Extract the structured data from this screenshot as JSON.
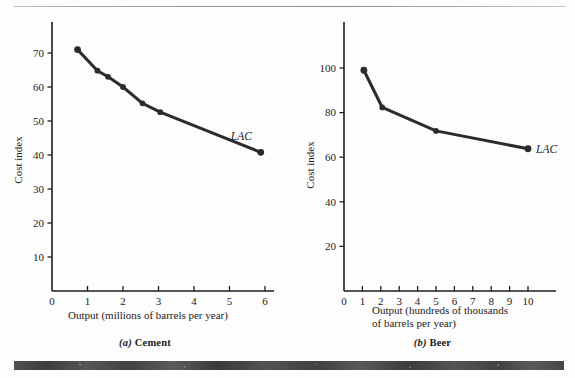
{
  "figure": {
    "panels": [
      {
        "id": "a",
        "caption_letter": "(a)",
        "caption_text": "Cement",
        "curve_label": "LAC"
      },
      {
        "id": "b",
        "caption_letter": "(b)",
        "caption_text": "Beer",
        "curve_label": "LAC"
      }
    ]
  },
  "chart_data": [
    {
      "type": "line",
      "title": "(a) Cement",
      "xlabel": "Output (millions of barrels per year)",
      "ylabel": "Cost index",
      "xlim": [
        0,
        6.6
      ],
      "ylim": [
        0,
        78
      ],
      "xticks": [
        0,
        1,
        2,
        3,
        4,
        5,
        6
      ],
      "xticklabels": [
        "0",
        "1",
        "2",
        "3",
        "4",
        "5",
        "6"
      ],
      "yticks": [
        10,
        20,
        30,
        40,
        50,
        60,
        70
      ],
      "yticklabels": [
        "10",
        "20",
        "30",
        "40",
        "50",
        "60",
        "70"
      ],
      "grid": false,
      "legend": "none",
      "series": [
        {
          "name": "LAC",
          "annotation": "LAC",
          "marker": "filled-circle",
          "color": "#2b2b2b",
          "x": [
            0.72,
            1.28,
            1.58,
            2.0,
            2.55,
            3.05,
            5.88
          ],
          "y": [
            71,
            64.8,
            63,
            60,
            55.2,
            52.6,
            40.8
          ]
        }
      ]
    },
    {
      "type": "line",
      "title": "(b) Beer",
      "xlabel": "Output (hundreds of thousands of barrels per year)",
      "xlabel_line1": "Output (hundreds of thousands",
      "xlabel_line2": "of barrels per year)",
      "ylabel": "Cost index",
      "xlim": [
        0,
        11.4
      ],
      "ylim": [
        0,
        118
      ],
      "xticks": [
        0,
        1,
        2,
        3,
        4,
        5,
        6,
        7,
        8,
        9,
        10
      ],
      "xticklabels": [
        "0",
        "1",
        "2",
        "3",
        "4",
        "5",
        "6",
        "7",
        "8",
        "9",
        "10"
      ],
      "yticks": [
        20,
        40,
        60,
        80,
        100
      ],
      "yticklabels": [
        "20",
        "40",
        "60",
        "80",
        "100"
      ],
      "grid": false,
      "legend": "none",
      "series": [
        {
          "name": "LAC",
          "annotation": "LAC",
          "marker": "filled-circle",
          "color": "#2b2b2b",
          "x": [
            1.08,
            2.08,
            5.0,
            10.0
          ],
          "y": [
            99,
            82.3,
            71.8,
            63.8
          ]
        }
      ]
    }
  ],
  "colors": {
    "curve": "#2b2b2b",
    "axis": "#1c1c1c",
    "background": "#fdfdfd",
    "bottom_bar": "#3b3b3b"
  }
}
